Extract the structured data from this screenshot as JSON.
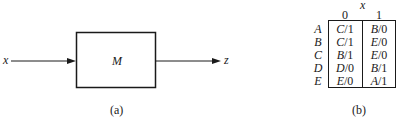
{
  "figure_a": {
    "block_label": "M",
    "input_label": "x",
    "output_label": "z",
    "caption": "(a)"
  },
  "figure_b": {
    "input_variable": "x",
    "columns": [
      "0",
      "1"
    ],
    "rows": [
      {
        "state": "A",
        "cells": [
          {
            "next": "C",
            "out": "1"
          },
          {
            "next": "B",
            "out": "0"
          }
        ]
      },
      {
        "state": "B",
        "cells": [
          {
            "next": "C",
            "out": "1"
          },
          {
            "next": "E",
            "out": "0"
          }
        ]
      },
      {
        "state": "C",
        "cells": [
          {
            "next": "B",
            "out": "1"
          },
          {
            "next": "E",
            "out": "0"
          }
        ]
      },
      {
        "state": "D",
        "cells": [
          {
            "next": "D",
            "out": "0"
          },
          {
            "next": "B",
            "out": "1"
          }
        ]
      },
      {
        "state": "E",
        "cells": [
          {
            "next": "E",
            "out": "0"
          },
          {
            "next": "A",
            "out": "1"
          }
        ]
      }
    ],
    "caption": "(b)"
  },
  "colors": {
    "ink": "#1a1a1a",
    "background": "#ffffff"
  }
}
